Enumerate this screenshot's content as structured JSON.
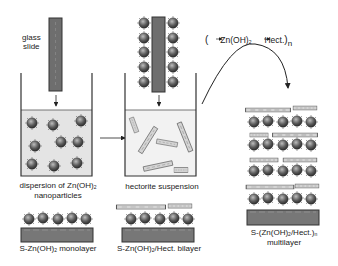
{
  "figure": {
    "type": "layer-by-layer assembly schematic",
    "colors": {
      "slide": "#6e6e6e",
      "slide_border": "#333333",
      "liquid": "#e6e6e6",
      "particle": "#555555",
      "hectorite": "#cfcfcf",
      "line": "#222222"
    }
  },
  "labels": {
    "glass_slide_1": "glass",
    "glass_slide_2": "slide",
    "dispersion_1": "dispersion of Zn(OH)",
    "dispersion_sub": "2",
    "dispersion_2": "nanoparticles",
    "hectorite": "hectorite suspension",
    "cycle_open": "(",
    "cycle_zn": "Zn(OH)",
    "cycle_zn_sub": "2",
    "cycle_hect": "Hect.",
    "cycle_close": ")",
    "cycle_n": "n",
    "monolayer_a": "S-Zn(OH)",
    "monolayer_sub": "2",
    "monolayer_b": " monolayer",
    "bilayer_a": "S-Zn(OH)",
    "bilayer_sub": "2",
    "bilayer_b": "/Hect. bilayer",
    "multilayer_a": "S-(Zn(OH)",
    "multilayer_sub": "2",
    "multilayer_b": "/Hect.)",
    "multilayer_n": "n",
    "multilayer_2": "multilayer"
  }
}
